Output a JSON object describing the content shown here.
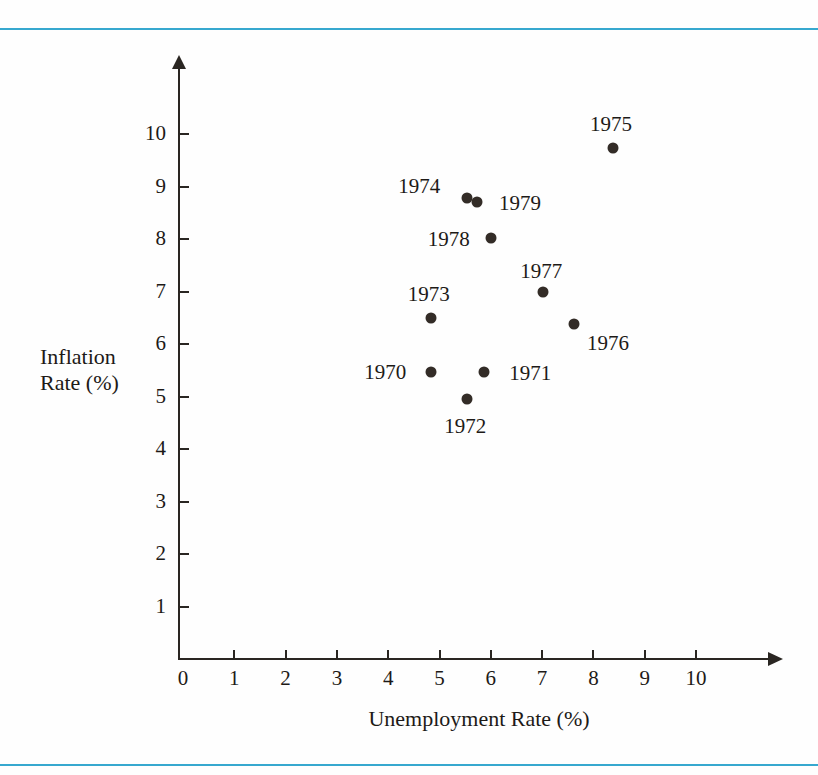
{
  "figure": {
    "top_rule_color": "#36a8cf",
    "bottom_rule_color": "#36a8cf",
    "background_color": "#fefefe",
    "ink_color": "#1d1a17",
    "marker_color": "#332c27"
  },
  "chart_data": {
    "type": "scatter",
    "title": "",
    "xlabel": "Unemployment Rate (%)",
    "ylabel": "Inflation\nRate (%)",
    "ylabel_lines": [
      "Inflation",
      "Rate (%)"
    ],
    "xlim": [
      0,
      11.4
    ],
    "ylim": [
      0,
      11.3
    ],
    "xticks": [
      0,
      1,
      2,
      3,
      4,
      5,
      6,
      7,
      8,
      9,
      10
    ],
    "yticks": [
      1,
      2,
      3,
      4,
      5,
      6,
      7,
      8,
      9,
      10
    ],
    "xtick_labels": [
      "0",
      "1",
      "2",
      "3",
      "4",
      "5",
      "6",
      "7",
      "8",
      "9",
      "10"
    ],
    "ytick_labels": [
      "1",
      "2",
      "3",
      "4",
      "5",
      "6",
      "7",
      "8",
      "9",
      "10"
    ],
    "grid": false,
    "legend": "none",
    "point_labels_shown": true,
    "points": [
      {
        "label": "1970",
        "x": 4.84,
        "y": 5.47,
        "label_dx": -46,
        "label_dy": 0
      },
      {
        "label": "1971",
        "x": 5.87,
        "y": 5.47,
        "label_dx": 46,
        "label_dy": 1
      },
      {
        "label": "1972",
        "x": 5.54,
        "y": 4.95,
        "label_dx": -2,
        "label_dy": 27
      },
      {
        "label": "1973",
        "x": 4.83,
        "y": 6.5,
        "label_dx": -2,
        "label_dy": -24
      },
      {
        "label": "1974",
        "x": 5.54,
        "y": 8.78,
        "label_dx": -48,
        "label_dy": -12
      },
      {
        "label": "1975",
        "x": 8.38,
        "y": 9.73,
        "label_dx": -2,
        "label_dy": -24
      },
      {
        "label": "1976",
        "x": 7.62,
        "y": 6.38,
        "label_dx": 34,
        "label_dy": 19
      },
      {
        "label": "1977",
        "x": 7.02,
        "y": 6.99,
        "label_dx": -2,
        "label_dy": -21
      },
      {
        "label": "1978",
        "x": 6.0,
        "y": 8.02,
        "label_dx": -42,
        "label_dy": 1
      },
      {
        "label": "1979",
        "x": 5.73,
        "y": 8.7,
        "label_dx": 43,
        "label_dy": 1
      }
    ]
  }
}
